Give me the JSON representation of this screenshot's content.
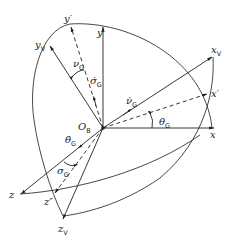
{
  "diagram": {
    "type": "coordinate-frame-rotation",
    "origin": {
      "label": "O",
      "sub": "B"
    },
    "axes": [
      {
        "id": "x",
        "label": "x",
        "sub": "",
        "style": "solid"
      },
      {
        "id": "y",
        "label": "y",
        "sub": "",
        "style": "solid"
      },
      {
        "id": "z",
        "label": "z",
        "sub": "",
        "style": "solid"
      },
      {
        "id": "x_prime",
        "label": "x'",
        "sub": "",
        "style": "dashed"
      },
      {
        "id": "y_prime",
        "label": "y'",
        "sub": "",
        "style": "dashed"
      },
      {
        "id": "z_dprime",
        "label": "z''",
        "sub": "",
        "style": "dashed"
      },
      {
        "id": "x_V",
        "label": "x",
        "sub": "V",
        "style": "solid"
      },
      {
        "id": "y_V",
        "label": "y",
        "sub": "V",
        "style": "solid"
      },
      {
        "id": "z_V",
        "label": "z",
        "sub": "V",
        "style": "solid"
      }
    ],
    "angles": [
      {
        "id": "theta_G",
        "label": "θ",
        "sub": "G",
        "between": [
          "x",
          "x'"
        ]
      },
      {
        "id": "nu_G",
        "label": "ν",
        "sub": "G",
        "between": [
          "y'",
          "y_V"
        ]
      },
      {
        "id": "sigma_G",
        "label": "σ",
        "sub": "G",
        "between": [
          "z",
          "z''"
        ]
      }
    ],
    "rates": [
      {
        "id": "theta_dot_G",
        "label": "θ̇",
        "sub": "G",
        "along": "z"
      },
      {
        "id": "nu_dot_G",
        "label": "ν̇",
        "sub": "G",
        "along": "x_V"
      },
      {
        "id": "sigma_dot_G",
        "label": "σ̇",
        "sub": "G",
        "along": "y'"
      }
    ]
  }
}
